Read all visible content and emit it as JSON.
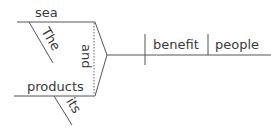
{
  "diagram": {
    "type": "Reed-Kellogg sentence diagram",
    "sentence_words": {
      "subject_1": "sea",
      "subject_1_modifier": "The",
      "conjunction": "and",
      "subject_2": "products",
      "subject_2_modifier": "its",
      "verb": "benefit",
      "direct_object": "people"
    },
    "colors": {
      "line": "#555555",
      "text": "#3a3a3a",
      "background": "#ffffff"
    }
  }
}
